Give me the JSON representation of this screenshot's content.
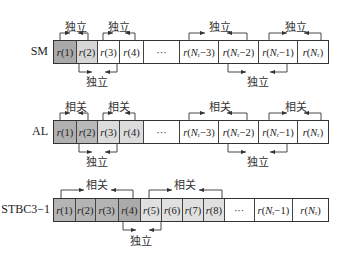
{
  "colors": {
    "dark": "#a9a9a9",
    "medium": "#c8c8c8",
    "light": "#e2e2e2",
    "white": "#ffffff",
    "line": "#333333"
  },
  "labels": {
    "independent": "独立",
    "correlated": "相关"
  },
  "rows": [
    {
      "name": "SM",
      "cells": [
        "r(1)",
        "r(2)",
        "r(3)",
        "r(4)",
        "···",
        "r(Nr−3)",
        "r(Nr−2)",
        "r(Nr−1)",
        "r(Nr)"
      ],
      "top_annotations": [
        "独立",
        "独立",
        "独立",
        "独立"
      ],
      "bottom_annotations": [
        "独立",
        "独立"
      ]
    },
    {
      "name": "AL",
      "cells": [
        "r(1)",
        "r(2)",
        "r(3)",
        "r(4)",
        "···",
        "r(Nr−3)",
        "r(Nr−2)",
        "r(Nr−1)",
        "r(Nr)"
      ],
      "top_annotations": [
        "相关",
        "相关",
        "相关",
        "相关"
      ],
      "bottom_annotations": [
        "独立",
        "独立"
      ]
    },
    {
      "name": "STBC3−1",
      "cells": [
        "r(1)",
        "r(2)",
        "r(3)",
        "r(4)",
        "r(5)",
        "r(6)",
        "r(7)",
        "r(8)",
        "···",
        "r(Nr−1)",
        "r(Nr)"
      ],
      "top_annotations": [
        "相关",
        "相关"
      ],
      "bottom_annotations": [
        "独立"
      ]
    }
  ]
}
